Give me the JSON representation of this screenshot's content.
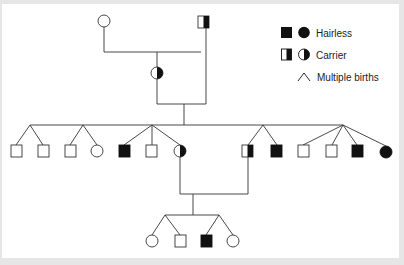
{
  "diagram": {
    "type": "pedigree",
    "colors": {
      "line": "#333333",
      "fill_affected": "#111111",
      "background": "#ffffff",
      "border": "#e6e6e6"
    }
  },
  "legend": {
    "items": [
      {
        "label": "Hairless",
        "symbols": [
          "square-filled",
          "circle-filled"
        ]
      },
      {
        "label": "Carrier",
        "symbols": [
          "square-half",
          "circle-half"
        ]
      },
      {
        "label": "Multiple births",
        "symbols": [
          "caret"
        ]
      }
    ]
  },
  "generations": [
    {
      "index": 1,
      "individuals": [
        {
          "id": "g1-female",
          "sex": "female",
          "status": "unaffected"
        },
        {
          "id": "g1-male",
          "sex": "male",
          "status": "carrier"
        }
      ]
    },
    {
      "index": 2,
      "individuals": [
        {
          "id": "g2-female",
          "sex": "female",
          "status": "carrier"
        }
      ]
    },
    {
      "index": 3,
      "sibships": [
        {
          "type": "twins",
          "members": [
            {
              "sex": "male",
              "status": "unaffected"
            },
            {
              "sex": "male",
              "status": "unaffected"
            }
          ]
        },
        {
          "type": "twins",
          "members": [
            {
              "sex": "male",
              "status": "unaffected"
            },
            {
              "sex": "female",
              "status": "unaffected"
            }
          ]
        },
        {
          "type": "triplets",
          "members": [
            {
              "sex": "male",
              "status": "hairless"
            },
            {
              "sex": "male",
              "status": "unaffected"
            },
            {
              "sex": "female",
              "status": "carrier"
            }
          ]
        },
        {
          "type": "twins",
          "members": [
            {
              "sex": "male",
              "status": "carrier"
            },
            {
              "sex": "male",
              "status": "hairless"
            }
          ]
        },
        {
          "type": "quadruplets",
          "members": [
            {
              "sex": "male",
              "status": "unaffected"
            },
            {
              "sex": "male",
              "status": "unaffected"
            },
            {
              "sex": "male",
              "status": "hairless"
            },
            {
              "sex": "female",
              "status": "hairless"
            }
          ]
        }
      ]
    },
    {
      "index": 4,
      "sibships": [
        {
          "type": "twins",
          "members": [
            {
              "sex": "female",
              "status": "unaffected"
            },
            {
              "sex": "male",
              "status": "unaffected"
            }
          ]
        },
        {
          "type": "twins",
          "members": [
            {
              "sex": "male",
              "status": "hairless"
            },
            {
              "sex": "female",
              "status": "unaffected"
            }
          ]
        }
      ]
    }
  ]
}
